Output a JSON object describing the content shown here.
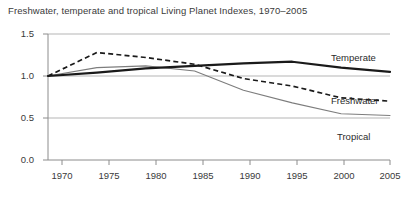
{
  "chart_data": {
    "type": "line",
    "title": "Freshwater, temperate and tropical Living Planet Indexes, 1970–2005",
    "xlabel": "",
    "ylabel": "",
    "x": [
      1970,
      1975,
      1980,
      1985,
      1990,
      1995,
      2000,
      2005
    ],
    "xlim": [
      1970,
      2005
    ],
    "ylim": [
      0.0,
      1.5
    ],
    "yticks": [
      "0.0",
      "0.5",
      "1.0",
      "1.5"
    ],
    "xticks": [
      "1970",
      "1975",
      "1980",
      "1985",
      "1990",
      "1995",
      "2000",
      "2005"
    ],
    "grid": "horizontal",
    "legend": "inline-right",
    "series": [
      {
        "name": "Temperate",
        "style": "solid-thick",
        "color": "#1a1a1a",
        "values": [
          1.0,
          1.04,
          1.09,
          1.12,
          1.15,
          1.17,
          1.1,
          1.05
        ]
      },
      {
        "name": "Freshwater",
        "style": "dashed",
        "color": "#1a1a1a",
        "values": [
          1.0,
          1.28,
          1.22,
          1.14,
          0.97,
          0.88,
          0.74,
          0.7
        ]
      },
      {
        "name": "Tropical",
        "style": "solid-thin",
        "color": "#7d7d7d",
        "values": [
          1.0,
          1.1,
          1.12,
          1.06,
          0.83,
          0.68,
          0.55,
          0.53
        ]
      }
    ]
  },
  "axes": {
    "y_labels": [
      "1.5",
      "1.0",
      "0.5",
      "0.0"
    ],
    "x_labels": [
      "1970",
      "1975",
      "1980",
      "1985",
      "1990",
      "1995",
      "2000",
      "2005"
    ]
  },
  "series_labels": {
    "temperate": "Temperate",
    "freshwater": "Freshwater",
    "tropical": "Tropical"
  },
  "colors": {
    "temperate": "#1a1a1a",
    "freshwater": "#1a1a1a",
    "tropical": "#7d7d7d",
    "grid": "#b5b5b5",
    "axis": "#8c8c8c",
    "text": "#3a3a3a"
  }
}
